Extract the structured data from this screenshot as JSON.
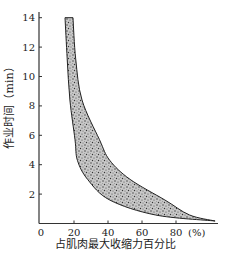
{
  "chart_data": {
    "type": "area",
    "title": "",
    "xlabel": "占肌肉最大收缩力百分比",
    "ylabel": "作业时间（min）",
    "x_unit_label": "(%)",
    "xlim": [
      0,
      100
    ],
    "ylim": [
      0,
      14
    ],
    "x_ticks": [
      0,
      20,
      40,
      60,
      80
    ],
    "y_ticks": [
      2,
      4,
      6,
      8,
      10,
      12,
      14
    ],
    "grid": false,
    "legend": null,
    "fill_style": "stippled",
    "band": {
      "lower_boundary": {
        "x": [
          14.7,
          16,
          17.6,
          20.6,
          22,
          28,
          41,
          68,
          103
        ],
        "y": [
          14,
          11.2,
          8.4,
          5.7,
          4.3,
          3.0,
          1.6,
          0.58,
          0.17
        ]
      },
      "upper_boundary": {
        "x": [
          19.4,
          21,
          24.7,
          35,
          41,
          53,
          73.5,
          88,
          103
        ],
        "y": [
          14,
          11.2,
          8.4,
          5.7,
          4.3,
          3.0,
          1.6,
          0.58,
          0.17
        ]
      }
    }
  },
  "colors": {
    "axis": "#333333",
    "band_fill": "#9a9a9a",
    "band_edge": "#222222"
  }
}
